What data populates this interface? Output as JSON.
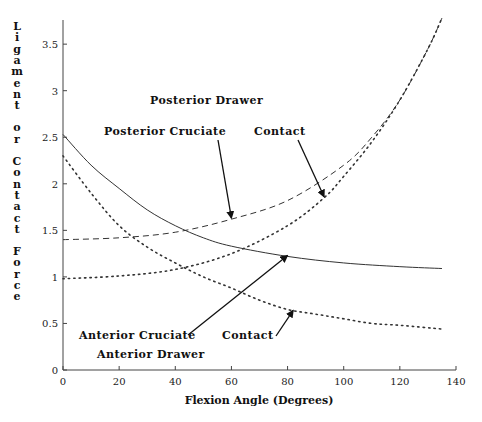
{
  "chart_data": {
    "type": "line",
    "title": "",
    "xlabel": "Flexion Angle (Degrees)",
    "ylabel": "Ligament or Contact Force",
    "xlim": [
      0,
      140
    ],
    "ylim": [
      0,
      3.75
    ],
    "xticks": [
      0,
      20,
      40,
      60,
      80,
      100,
      120,
      140
    ],
    "yticks": [
      0,
      0.5,
      1,
      1.5,
      2,
      2.5,
      3,
      3.5
    ],
    "ytick_labels": [
      "0",
      "0.5",
      "1",
      "1.5",
      "2",
      "2.5",
      "3",
      "3.5"
    ],
    "xtick_labels": [
      "0",
      "20",
      "40",
      "60",
      "80",
      "100",
      "120",
      "140"
    ],
    "grid": false,
    "legend": null,
    "series": [
      {
        "name": "Posterior Cruciate",
        "group": "Posterior Drawer",
        "style": "dashed",
        "x": [
          0,
          20,
          40,
          60,
          80,
          100,
          110,
          120,
          130,
          135
        ],
        "y": [
          1.4,
          1.42,
          1.48,
          1.62,
          1.82,
          2.2,
          2.5,
          2.9,
          3.45,
          3.78
        ]
      },
      {
        "name": "Contact (Posterior Drawer)",
        "group": "Posterior Drawer",
        "style": "dotted",
        "x": [
          0,
          20,
          40,
          60,
          80,
          93,
          100,
          110,
          120,
          130,
          135
        ],
        "y": [
          0.98,
          1.01,
          1.08,
          1.25,
          1.55,
          1.85,
          2.08,
          2.45,
          2.9,
          3.45,
          3.78
        ]
      },
      {
        "name": "Anterior Cruciate",
        "group": "Anterior Drawer",
        "style": "solid",
        "x": [
          0,
          10,
          20,
          30,
          40,
          50,
          60,
          80,
          100,
          120,
          135
        ],
        "y": [
          2.53,
          2.2,
          1.95,
          1.72,
          1.55,
          1.42,
          1.33,
          1.22,
          1.15,
          1.11,
          1.09
        ]
      },
      {
        "name": "Contact (Anterior Drawer)",
        "group": "Anterior Drawer",
        "style": "dotted",
        "x": [
          0,
          10,
          20,
          30,
          40,
          50,
          60,
          70,
          80,
          90,
          100,
          110,
          120,
          135
        ],
        "y": [
          2.3,
          1.9,
          1.55,
          1.32,
          1.15,
          1.0,
          0.88,
          0.75,
          0.65,
          0.6,
          0.55,
          0.5,
          0.48,
          0.44
        ]
      }
    ],
    "annotations": [
      {
        "text": "Posterior Drawer",
        "x_px": 150,
        "y_px": 104
      },
      {
        "text": "Posterior Cruciate",
        "x_px": 104,
        "y_px": 135,
        "arrow_to": [
          60,
          1.62
        ]
      },
      {
        "text": "Contact",
        "x_px": 254,
        "y_px": 135,
        "arrow_to": [
          93,
          1.85
        ]
      },
      {
        "text": "Anterior Cruciate",
        "x_px": 79,
        "y_px": 339,
        "arrow_to": [
          80,
          1.22
        ]
      },
      {
        "text": "Contact",
        "x_px": 222,
        "y_px": 339,
        "arrow_to": [
          82,
          0.63
        ]
      },
      {
        "text": "Anterior Drawer",
        "x_px": 97,
        "y_px": 358
      }
    ]
  }
}
